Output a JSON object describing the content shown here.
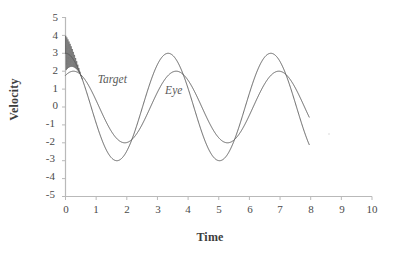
{
  "chart_data": {
    "type": "line",
    "title": "",
    "xlabel": "Time",
    "ylabel": "Velocity",
    "xlim": [
      0,
      10
    ],
    "ylim": [
      -5,
      5
    ],
    "xticks": [
      "0",
      "1",
      "2",
      "3",
      "4",
      "5",
      "6",
      "7",
      "8",
      "9",
      "10"
    ],
    "yticks": [
      "5",
      "4",
      "3",
      "2",
      "1",
      "0",
      "-1",
      "-2",
      "-3",
      "-4",
      "-5"
    ],
    "grid": false,
    "legend_position": "inline-annotations",
    "series": [
      {
        "name": "Target",
        "label": "Target",
        "color": "#555555",
        "amplitude": 3,
        "period": 3.35,
        "phase_deg": 90,
        "t_start": 0,
        "t_end": 7.95,
        "has_initial_transient": true,
        "transient_peak": 4.0,
        "transient_t_end": 0.55,
        "transient_frequency_hz": 28,
        "x": [
          0.0,
          0.2,
          0.4,
          0.6,
          0.8,
          1.0,
          1.2,
          1.4,
          1.6,
          1.8,
          2.0,
          2.2,
          2.4,
          2.6,
          2.8,
          3.0,
          3.2,
          3.4,
          3.6,
          3.8,
          4.0,
          4.2,
          4.4,
          4.6,
          4.8,
          5.0,
          5.2,
          5.4,
          5.6,
          5.8,
          6.0,
          6.2,
          6.4,
          6.6,
          6.8,
          7.0,
          7.2,
          7.4,
          7.6,
          7.8,
          7.95
        ],
        "y": [
          3.0,
          2.68,
          1.79,
          0.53,
          -0.83,
          -2.0,
          -2.76,
          -2.99,
          -2.64,
          -1.77,
          -0.51,
          0.85,
          2.01,
          2.76,
          2.99,
          2.63,
          1.75,
          0.49,
          -0.87,
          -2.02,
          -2.77,
          -2.99,
          -2.62,
          -1.73,
          -0.47,
          0.89,
          2.03,
          2.77,
          2.99,
          2.61,
          1.71,
          0.45,
          -0.91,
          -2.05,
          -2.78,
          -2.99,
          -2.6,
          -1.69,
          -0.43,
          0.93,
          1.55
        ]
      },
      {
        "name": "Eye",
        "label": "Eye",
        "color": "#555555",
        "amplitude": 2,
        "period": 3.35,
        "phase_deg": 62,
        "t_start": 0,
        "t_end": 7.95,
        "has_initial_transient": false,
        "x": [
          0.0,
          0.2,
          0.4,
          0.6,
          0.8,
          1.0,
          1.2,
          1.4,
          1.6,
          1.8,
          2.0,
          2.2,
          2.4,
          2.6,
          2.8,
          3.0,
          3.2,
          3.4,
          3.6,
          3.8,
          4.0,
          4.2,
          4.4,
          4.6,
          4.8,
          5.0,
          5.2,
          5.4,
          5.6,
          5.8,
          6.0,
          6.2,
          6.4,
          6.6,
          6.8,
          7.0,
          7.2,
          7.4,
          7.6,
          7.8,
          7.95
        ],
        "y": [
          1.77,
          1.99,
          1.81,
          1.24,
          0.41,
          -0.5,
          -1.3,
          -1.83,
          -2.0,
          -1.77,
          -1.19,
          -0.35,
          0.56,
          1.34,
          1.85,
          2.0,
          1.75,
          1.15,
          0.3,
          -0.61,
          -1.38,
          -1.87,
          -2.0,
          -1.73,
          -1.11,
          -0.24,
          0.66,
          1.42,
          1.89,
          1.99,
          1.7,
          1.07,
          0.19,
          -0.71,
          -1.46,
          -1.9,
          -1.99,
          -1.68,
          -1.03,
          -0.13,
          0.45
        ]
      }
    ],
    "annotations": [
      {
        "text": "Target",
        "x": 1.05,
        "y": 1.45
      },
      {
        "text": "Eye",
        "x": 3.25,
        "y": 0.85
      }
    ]
  },
  "axes": {
    "x_axis_name": "time-axis",
    "y_axis_name": "velocity-axis"
  }
}
